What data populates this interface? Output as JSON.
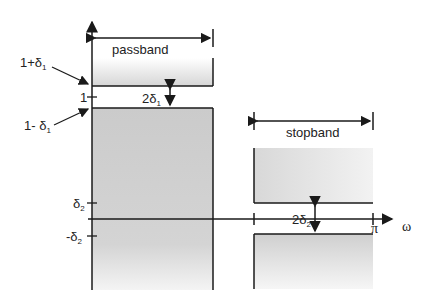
{
  "diagram": {
    "labels": {
      "passband": "passband",
      "stopband": "stopband",
      "one_plus_delta1": "1+δ",
      "one_plus_delta1_sub": "1",
      "one": "1",
      "one_minus_delta1": "1- δ",
      "one_minus_delta1_sub": "1",
      "two_delta1": "2δ",
      "two_delta1_sub": "1",
      "delta2": "δ",
      "delta2_sub": "2",
      "minus_delta2": "-δ",
      "minus_delta2_sub": "2",
      "two_delta2": "2δ",
      "two_delta2_sub": "2",
      "pi": "π",
      "omega": "ω"
    },
    "colors": {
      "line": "#1a1a1a",
      "fill_dark": "#cfcfcf",
      "fill_light": "#ffffff"
    }
  }
}
